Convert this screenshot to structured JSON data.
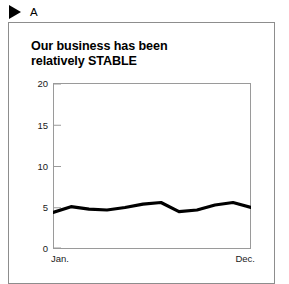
{
  "figure": {
    "marker_icon": "right-triangle-icon",
    "letter": "A"
  },
  "chart_data": {
    "type": "line",
    "title": "Our business has been relatively STABLE",
    "title_line1": "Our business has been",
    "title_line2": "relatively STABLE",
    "xlabel": "",
    "ylabel": "",
    "ylim": [
      0,
      20
    ],
    "yticks": [
      "20",
      "15",
      "10",
      "5",
      "0"
    ],
    "ytick_values": [
      20,
      15,
      10,
      5,
      0
    ],
    "xticks": [
      "Jan.",
      "Dec."
    ],
    "categories": [
      "Jan.",
      "Feb.",
      "Mar.",
      "Apr.",
      "May",
      "Jun.",
      "Jul.",
      "Aug.",
      "Sep.",
      "Oct.",
      "Nov.",
      "Dec."
    ],
    "values": [
      4.4,
      5.1,
      4.8,
      4.7,
      5.0,
      5.4,
      5.6,
      4.5,
      4.7,
      5.3,
      5.6,
      5.0
    ],
    "series": [
      {
        "name": "business",
        "values": [
          4.4,
          5.1,
          4.8,
          4.7,
          5.0,
          5.4,
          5.6,
          4.5,
          4.7,
          5.3,
          5.6,
          5.0
        ]
      }
    ],
    "grid": false,
    "legend": false,
    "line_color": "#000000",
    "line_width": 3.2
  },
  "colors": {
    "line": "#000000",
    "axis": "#9a9a9a",
    "panel_border": "#8d8d8d",
    "text": "#000000",
    "background": "#ffffff"
  }
}
